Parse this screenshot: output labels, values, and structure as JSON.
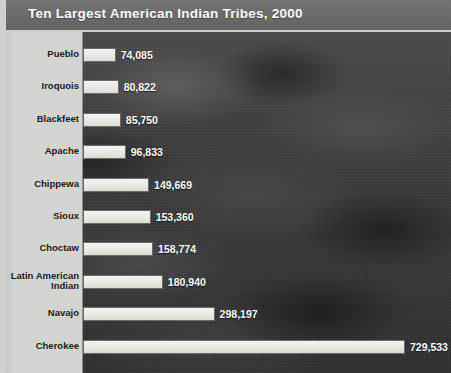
{
  "header": {
    "title": "Ten Largest American Indian Tribes, 2000"
  },
  "colors": {
    "title_band": "#6e6e6e",
    "title_text": "#ffffff",
    "label_panel": "#d2d2cf",
    "plot_background": "#3e3e3e",
    "bar_fill": "#e9e9e4",
    "bar_border": "#6a6a66",
    "value_text": "#ffffff"
  },
  "chart_data": {
    "type": "bar",
    "orientation": "horizontal",
    "title": "Ten Largest American Indian Tribes, 2000",
    "xlabel": "",
    "ylabel": "",
    "xlim": [
      0,
      729533
    ],
    "grid": false,
    "legend": false,
    "axis_ticks_visible": false,
    "categories": [
      "Pueblo",
      "Iroquois",
      "Blackfeet",
      "Apache",
      "Chippewa",
      "Sioux",
      "Choctaw",
      "Latin American\nIndian",
      "Navajo",
      "Cherokee"
    ],
    "values": [
      74085,
      80822,
      85750,
      96833,
      149669,
      153360,
      158774,
      180940,
      298197,
      729533
    ],
    "value_labels": [
      "74,085",
      "80,822",
      "85,750",
      "96,833",
      "149,669",
      "153,360",
      "158,774",
      "180,940",
      "298,197",
      "729,533"
    ]
  }
}
